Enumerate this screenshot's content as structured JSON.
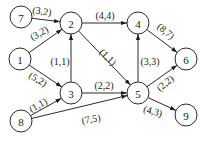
{
  "diagram": {
    "type": "directed-network-flow",
    "node_radius": 11,
    "nodes": [
      {
        "id": "1",
        "label": "1",
        "x": 20,
        "y": 59
      },
      {
        "id": "2",
        "label": "2",
        "x": 71,
        "y": 23
      },
      {
        "id": "3",
        "label": "3",
        "x": 71,
        "y": 93
      },
      {
        "id": "4",
        "label": "4",
        "x": 138,
        "y": 23
      },
      {
        "id": "5",
        "label": "5",
        "x": 138,
        "y": 93
      },
      {
        "id": "6",
        "label": "6",
        "x": 186,
        "y": 59
      },
      {
        "id": "7",
        "label": "7",
        "x": 21,
        "y": 17
      },
      {
        "id": "8",
        "label": "8",
        "x": 21,
        "y": 121
      },
      {
        "id": "9",
        "label": "9",
        "x": 186,
        "y": 115
      }
    ],
    "edges": [
      {
        "from": "7",
        "to": "2",
        "label": "(3,2)",
        "lx": 42,
        "ly": 11,
        "rot": 8
      },
      {
        "from": "1",
        "to": "2",
        "label": "(3,2)",
        "lx": 39,
        "ly": 33,
        "rot": -30
      },
      {
        "from": "1",
        "to": "3",
        "label": "(5,2)",
        "lx": 38,
        "ly": 79,
        "rot": 30
      },
      {
        "from": "3",
        "to": "2",
        "label": "(1,1)",
        "lx": 60,
        "ly": 61,
        "rot": 0
      },
      {
        "from": "2",
        "to": "4",
        "label": "(4,4)",
        "lx": 105,
        "ly": 15,
        "rot": 0
      },
      {
        "from": "2",
        "to": "5",
        "label": "(1,1)",
        "lx": 108,
        "ly": 57,
        "rot": 45
      },
      {
        "from": "4",
        "to": "6",
        "label": "(8,7)",
        "lx": 166,
        "ly": 31,
        "rot": 40
      },
      {
        "from": "3",
        "to": "5",
        "label": "(2,2)",
        "lx": 104,
        "ly": 85,
        "rot": 0
      },
      {
        "from": "5",
        "to": "4",
        "label": "(3,3)",
        "lx": 150,
        "ly": 61,
        "rot": 0
      },
      {
        "from": "5",
        "to": "6",
        "label": "(2,2)",
        "lx": 165,
        "ly": 83,
        "rot": -40
      },
      {
        "from": "5",
        "to": "9",
        "label": "(4,3)",
        "lx": 153,
        "ly": 111,
        "rot": 15
      },
      {
        "from": "8",
        "to": "3",
        "label": "(1,1)",
        "lx": 38,
        "ly": 105,
        "rot": -30
      },
      {
        "from": "8",
        "to": "5",
        "label": "(7,5)",
        "lx": 91,
        "ly": 119,
        "rot": -10
      }
    ]
  }
}
